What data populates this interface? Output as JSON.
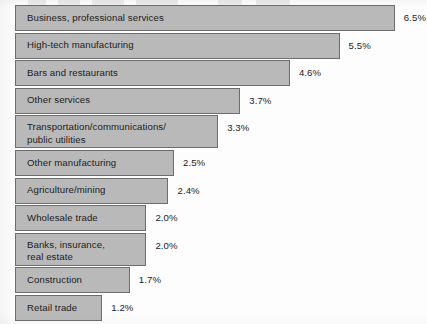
{
  "chart_data": {
    "type": "bar",
    "orientation": "horizontal",
    "title": "",
    "xlabel": "",
    "ylabel": "",
    "grid": false,
    "legend": false,
    "value_suffix": "%",
    "xlim": [
      0,
      6.5
    ],
    "categories": [
      "Business, professional services",
      "High-tech manufacturing",
      "Bars and restaurants",
      "Other services",
      "Transportation/communications/\npublic utilities",
      "Other manufacturing",
      "Agriculture/mining",
      "Wholesale trade",
      "Banks, insurance,\nreal estate",
      "Construction",
      "Retail trade"
    ],
    "values": [
      6.5,
      5.5,
      4.6,
      3.7,
      3.3,
      2.5,
      2.4,
      2.0,
      2.0,
      1.7,
      1.2
    ],
    "value_labels": [
      "6.5%",
      "5.5%",
      "4.6%",
      "3.7%",
      "3.3%",
      "2.5%",
      "2.4%",
      "2.0%",
      "2.0%",
      "1.7%",
      "1.2%"
    ],
    "bars": [
      {
        "label": "Business, professional services",
        "value": 6.5,
        "value_label": "6.5%",
        "lines": 1
      },
      {
        "label": "High-tech manufacturing",
        "value": 5.5,
        "value_label": "5.5%",
        "lines": 1
      },
      {
        "label": "Bars and restaurants",
        "value": 4.6,
        "value_label": "4.6%",
        "lines": 1
      },
      {
        "label": "Other services",
        "value": 3.7,
        "value_label": "3.7%",
        "lines": 1
      },
      {
        "label": "Transportation/communications/\npublic utilities",
        "value": 3.3,
        "value_label": "3.3%",
        "lines": 2
      },
      {
        "label": "Other manufacturing",
        "value": 2.5,
        "value_label": "2.5%",
        "lines": 1
      },
      {
        "label": "Agriculture/mining",
        "value": 2.4,
        "value_label": "2.4%",
        "lines": 1
      },
      {
        "label": "Wholesale trade",
        "value": 2.0,
        "value_label": "2.0%",
        "lines": 1
      },
      {
        "label": "Banks, insurance,\nreal estate",
        "value": 2.0,
        "value_label": "2.0%",
        "lines": 2
      },
      {
        "label": "Construction",
        "value": 1.7,
        "value_label": "1.7%",
        "lines": 1
      },
      {
        "label": "Retail trade",
        "value": 1.2,
        "value_label": "1.2%",
        "lines": 1
      }
    ],
    "colors": {
      "bar_fill": "#b9b9b9",
      "bar_border": "#6d6d6d",
      "text": "#1c1c1c",
      "background": "#fdfdfd"
    }
  }
}
